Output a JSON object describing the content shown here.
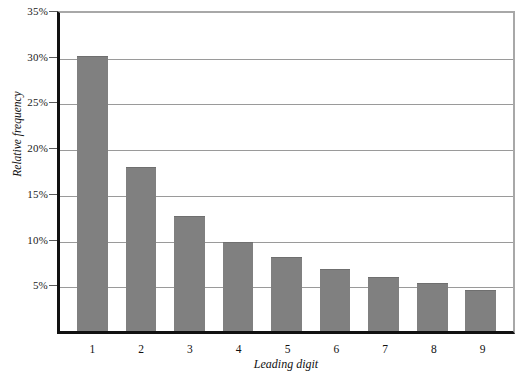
{
  "chart_data": {
    "type": "bar",
    "title": "",
    "subtitle": "",
    "xlabel": "Leading digit",
    "ylabel": "Relative frequency",
    "categories": [
      "1",
      "2",
      "3",
      "4",
      "5",
      "6",
      "7",
      "8",
      "9"
    ],
    "values": [
      30.1,
      17.9,
      12.6,
      9.7,
      8.1,
      6.8,
      5.9,
      5.3,
      4.5
    ],
    "value_labels": [
      "30.1%",
      "17.9%",
      "12.6%",
      "9.7%",
      "8.1%",
      "6.8%",
      "5.9%",
      "5.3%",
      "4.5%"
    ],
    "ylim": [
      0,
      35
    ],
    "ytick_values": [
      5,
      10,
      15,
      20,
      25,
      30,
      35
    ],
    "ytick_labels": [
      "5%",
      "10%",
      "15%",
      "20%",
      "25%",
      "30%",
      "35%"
    ],
    "grid": true,
    "grid_axis": "y",
    "legend": false,
    "legend_position": "none",
    "bar_color": "#808080",
    "bar_edge_color": "#6f6f6f",
    "gridline_color": "#9a9a9a",
    "axis_color": "#111111",
    "frame_color": "#a8a8a8",
    "background_color": "#ffffff"
  }
}
